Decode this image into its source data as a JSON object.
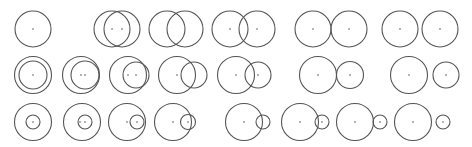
{
  "diagram": {
    "stroke_color": "#555555",
    "background": "#ffffff",
    "rows": [
      {
        "name": "equal-radii",
        "cy": 29,
        "configurations": [
          {
            "label": "coincident",
            "circles": [
              {
                "cx": 33,
                "r": 18
              }
            ],
            "dots": [
              33
            ]
          },
          {
            "label": "overlap-large",
            "circles": [
              {
                "cx": 112,
                "r": 18
              },
              {
                "cx": 122,
                "r": 18
              }
            ],
            "dots": [
              112,
              122
            ]
          },
          {
            "label": "overlap-medium",
            "circles": [
              {
                "cx": 167,
                "r": 18
              },
              {
                "cx": 185,
                "r": 18
              }
            ],
            "dots": []
          },
          {
            "label": "overlap-small",
            "circles": [
              {
                "cx": 230,
                "r": 18
              },
              {
                "cx": 257,
                "r": 18
              }
            ],
            "dots": [
              230,
              257
            ]
          },
          {
            "label": "tangent-external",
            "circles": [
              {
                "cx": 313,
                "r": 18
              },
              {
                "cx": 349,
                "r": 18
              }
            ],
            "dots": [
              313,
              349
            ]
          },
          {
            "label": "separate",
            "circles": [
              {
                "cx": 400,
                "r": 18
              },
              {
                "cx": 440,
                "r": 18
              }
            ],
            "dots": [
              400,
              440
            ]
          }
        ]
      },
      {
        "name": "medium-difference-radii",
        "cy": 75,
        "configurations": [
          {
            "label": "concentric",
            "circles": [
              {
                "cx": 33,
                "r": 18.5
              },
              {
                "cx": 33,
                "r": 14
              }
            ],
            "dots": [
              33
            ]
          },
          {
            "label": "internal-contained",
            "circles": [
              {
                "cx": 81,
                "r": 18.5
              },
              {
                "cx": 85,
                "r": 14
              }
            ],
            "dots": [
              81,
              85
            ]
          },
          {
            "label": "tangent-internal",
            "circles": [
              {
                "cx": 128,
                "r": 18.5
              },
              {
                "cx": 136,
                "r": 13
              }
            ],
            "dots": [
              128,
              136
            ]
          },
          {
            "label": "intersecting-a",
            "circles": [
              {
                "cx": 177,
                "r": 18.5
              },
              {
                "cx": 194,
                "r": 13
              }
            ],
            "dots": [
              177
            ]
          },
          {
            "label": "intersecting-b",
            "circles": [
              {
                "cx": 236,
                "r": 18.5
              },
              {
                "cx": 258,
                "r": 13
              }
            ],
            "dots": [
              236,
              258
            ]
          },
          {
            "label": "tangent-external",
            "circles": [
              {
                "cx": 318,
                "r": 18.5
              },
              {
                "cx": 350,
                "r": 13.5
              }
            ],
            "dots": [
              318,
              350
            ]
          },
          {
            "label": "separate",
            "circles": [
              {
                "cx": 409,
                "r": 18.5
              },
              {
                "cx": 446,
                "r": 13
              }
            ],
            "dots": [
              409,
              446
            ]
          }
        ]
      },
      {
        "name": "large-difference-radii",
        "cy": 122,
        "configurations": [
          {
            "label": "concentric",
            "circles": [
              {
                "cx": 33,
                "r": 18.5
              },
              {
                "cx": 33,
                "r": 7
              }
            ],
            "dots": [
              33
            ]
          },
          {
            "label": "internal-contained",
            "circles": [
              {
                "cx": 82,
                "r": 18.5
              },
              {
                "cx": 85,
                "r": 7
              }
            ],
            "dots": [
              80,
              85
            ]
          },
          {
            "label": "tangent-internal",
            "circles": [
              {
                "cx": 127,
                "r": 18.5
              },
              {
                "cx": 137,
                "r": 7
              }
            ],
            "dots": [
              127,
              137
            ]
          },
          {
            "label": "intersecting-a",
            "circles": [
              {
                "cx": 173,
                "r": 18.5
              },
              {
                "cx": 188,
                "r": 7.5
              }
            ],
            "dots": [
              173,
              188
            ]
          },
          {
            "label": "intersecting-b",
            "circles": [
              {
                "cx": 244,
                "r": 18.5
              },
              {
                "cx": 263,
                "r": 7
              }
            ],
            "dots": [
              244
            ]
          },
          {
            "label": "tangent-external",
            "circles": [
              {
                "cx": 300,
                "r": 18.5
              },
              {
                "cx": 322,
                "r": 7
              }
            ],
            "dots": [
              300,
              322
            ]
          },
          {
            "label": "separate-near",
            "circles": [
              {
                "cx": 355,
                "r": 18.5
              },
              {
                "cx": 380,
                "r": 7
              }
            ],
            "dots": [
              355,
              380
            ]
          },
          {
            "label": "separate-far",
            "circles": [
              {
                "cx": 413,
                "r": 18.5
              },
              {
                "cx": 443,
                "r": 7
              }
            ],
            "dots": [
              413,
              443
            ]
          }
        ]
      }
    ]
  }
}
